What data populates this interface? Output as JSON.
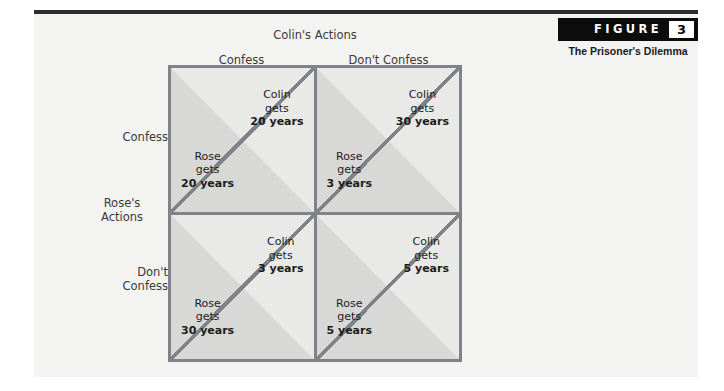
{
  "figure": {
    "word": "FIGURE",
    "number": "3",
    "caption": "The Prisoner's Dilemma"
  },
  "matrix": {
    "column_group_title": "Colin's Actions",
    "row_group_title": "Rose's\nActions",
    "row_group_title_line1": "Rose's",
    "row_group_title_line2": "Actions",
    "column_headers": [
      "Confess",
      "Don't Confess"
    ],
    "row_headers": [
      "Confess",
      "Don't\nConfess"
    ],
    "row_header_0_line1": "Confess",
    "row_header_1_line1": "Don't",
    "row_header_1_line2": "Confess",
    "player_colin": "Colin",
    "player_rose": "Rose",
    "verb": "gets",
    "cells": [
      {
        "id": "confess-confess",
        "colin_label": "Colin",
        "colin_verb": "gets",
        "colin_payoff": "20 years",
        "rose_label": "Rose",
        "rose_verb": "gets",
        "rose_payoff": "20 years"
      },
      {
        "id": "confess-dontconfess",
        "colin_label": "Colin",
        "colin_verb": "gets",
        "colin_payoff": "30 years",
        "rose_label": "Rose",
        "rose_verb": "gets",
        "rose_payoff": "3 years"
      },
      {
        "id": "dontconfess-confess",
        "colin_label": "Colin",
        "colin_verb": "gets",
        "colin_payoff": "3 years",
        "rose_label": "Rose",
        "rose_verb": "gets",
        "rose_payoff": "30 years"
      },
      {
        "id": "dontconfess-dontconfess",
        "colin_label": "Colin",
        "colin_verb": "gets",
        "colin_payoff": "5 years",
        "rose_label": "Rose",
        "rose_verb": "gets",
        "rose_payoff": "5 years"
      }
    ]
  },
  "colors": {
    "page_background": "#f3f3f1",
    "rule": "#2b2b2b",
    "badge_background": "#0c0c0c",
    "badge_text": "#ffffff",
    "grid_line": "#7f8286",
    "cell_upper_fill": "#e9e9e7",
    "cell_lower_fill": "#d8d8d6",
    "label_text": "#3a3a3a",
    "payoff_text": "#1c1c1c"
  }
}
